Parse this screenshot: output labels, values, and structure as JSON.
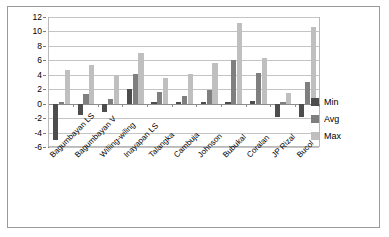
{
  "chart_data": {
    "type": "bar",
    "title": "",
    "xlabel": "",
    "ylabel": "",
    "ylim": [
      -6,
      12
    ],
    "yticks": [
      -6,
      -4,
      -2,
      0,
      2,
      4,
      6,
      8,
      10,
      12
    ],
    "grid": true,
    "legend_position": "right",
    "categories": [
      "Bagumbayan LS",
      "Bagumbayan V",
      "Wiliing-wiling",
      "Inayapan LS",
      "Talangka",
      "Cambuja",
      "Johnson",
      "Bubukal",
      "Coralan",
      "JP Rizal",
      "Bucol"
    ],
    "series": [
      {
        "name": "Min",
        "color": "#4d4d4d",
        "values": [
          -5.0,
          -1.6,
          -1.2,
          2.0,
          0.3,
          0.2,
          0.3,
          0.3,
          0.4,
          -1.9,
          -1.8
        ]
      },
      {
        "name": "Avg",
        "color": "#7f7f7f",
        "values": [
          0.3,
          1.3,
          0.7,
          4.1,
          1.6,
          1.0,
          1.9,
          6.0,
          4.3,
          0.3,
          3.0
        ]
      },
      {
        "name": "Max",
        "color": "#bfbfbf",
        "values": [
          4.7,
          5.3,
          4.0,
          7.0,
          3.5,
          4.1,
          5.6,
          11.2,
          6.3,
          1.5,
          10.6
        ]
      }
    ]
  },
  "legend": {
    "items": [
      {
        "label": "Min",
        "color": "#4d4d4d"
      },
      {
        "label": "Avg",
        "color": "#7f7f7f"
      },
      {
        "label": "Max",
        "color": "#bfbfbf"
      }
    ]
  }
}
